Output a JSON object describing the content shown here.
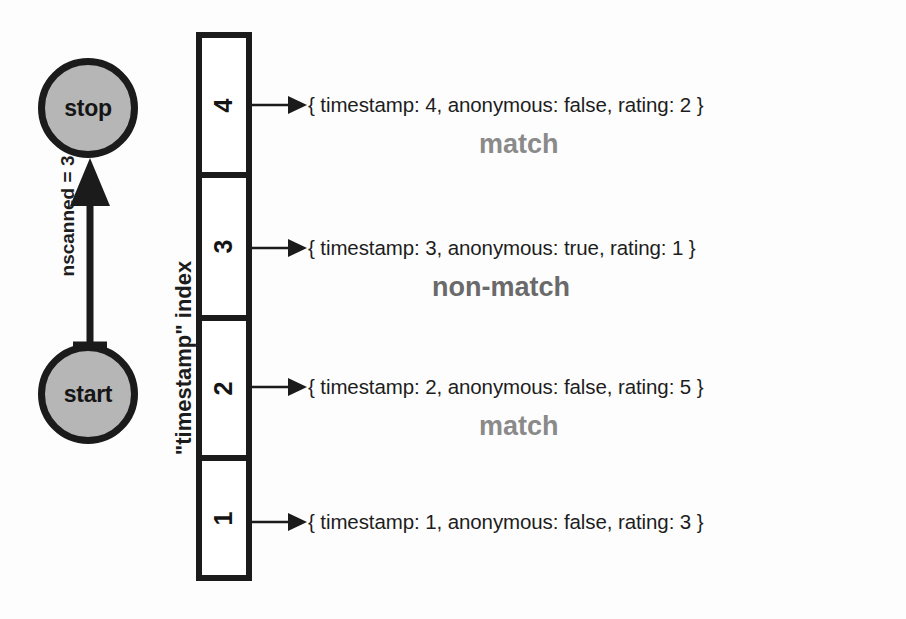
{
  "diagram": {
    "index_label": "\"timestamp\" index",
    "scan_label": "nscanned = 3",
    "states": {
      "stop": "stop",
      "start": "start"
    },
    "colors": {
      "node_fill": "#b6b6b6",
      "node_stroke": "#1b1b1b",
      "line": "#1b1b1b",
      "match_text": "#8a8a8a",
      "nonmatch_text": "#6a6a6a",
      "background": "#fdfdfd"
    },
    "index_cells": [
      {
        "key": "4"
      },
      {
        "key": "3"
      },
      {
        "key": "2"
      },
      {
        "key": "1"
      }
    ],
    "documents": [
      {
        "text": "{ timestamp: 4, anonymous: false, rating: 2 }"
      },
      {
        "text": "{ timestamp: 3, anonymous: true, rating: 1 }"
      },
      {
        "text": "{ timestamp: 2, anonymous: false, rating: 5 }"
      },
      {
        "text": "{ timestamp: 1, anonymous: false, rating: 3 }"
      }
    ],
    "verdicts": [
      {
        "text": "match"
      },
      {
        "text": "non-match"
      },
      {
        "text": "match"
      }
    ]
  }
}
